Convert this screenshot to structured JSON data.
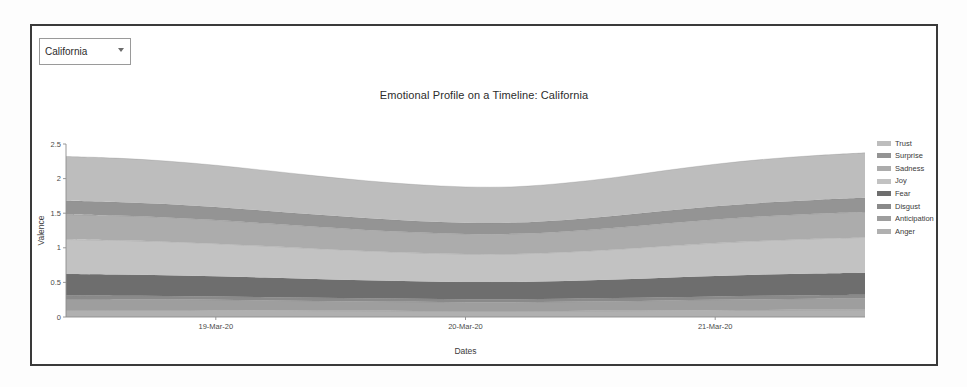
{
  "panel": {
    "state_filter": {
      "selected": "California",
      "options": [
        "California"
      ],
      "caret_icon": "chevron-down-icon"
    }
  },
  "chart_data": {
    "type": "area",
    "stacked": true,
    "title": "Emotional Profile on a Timeline: California",
    "xlabel": "Dates",
    "ylabel": "Valence",
    "ylim": [
      0,
      2.5
    ],
    "yticks": [
      0,
      0.5,
      1,
      1.5,
      2,
      2.5
    ],
    "ytick_labels": [
      "0",
      "0.5",
      "1",
      "1.5",
      "2",
      "2.5"
    ],
    "xticks": [
      "19-Mar-20",
      "20-Mar-20",
      "21-Mar-20"
    ],
    "xtick_positions": [
      0.1875,
      0.5,
      0.8125
    ],
    "grid": false,
    "legend_position": "right",
    "legend_order": [
      "Trust",
      "Surprise",
      "Sadness",
      "Joy",
      "Fear",
      "Disgust",
      "Anticipation",
      "Anger"
    ],
    "x": [
      0,
      0.0625,
      0.125,
      0.1875,
      0.25,
      0.3125,
      0.375,
      0.4375,
      0.5,
      0.5625,
      0.625,
      0.6875,
      0.75,
      0.8125,
      0.875,
      0.9375,
      1
    ],
    "series": [
      {
        "name": "Anger",
        "color": "#b0b0b0",
        "values": [
          0.1,
          0.1,
          0.1,
          0.098,
          0.095,
          0.092,
          0.09,
          0.088,
          0.086,
          0.086,
          0.088,
          0.09,
          0.094,
          0.098,
          0.1,
          0.103,
          0.105
        ]
      },
      {
        "name": "Anticipation",
        "color": "#9e9e9e",
        "values": [
          0.16,
          0.158,
          0.155,
          0.15,
          0.145,
          0.14,
          0.135,
          0.131,
          0.128,
          0.128,
          0.132,
          0.138,
          0.145,
          0.152,
          0.158,
          0.162,
          0.165
        ]
      },
      {
        "name": "Disgust",
        "color": "#8a8a8a",
        "values": [
          0.05,
          0.05,
          0.049,
          0.048,
          0.047,
          0.046,
          0.045,
          0.044,
          0.043,
          0.043,
          0.044,
          0.045,
          0.047,
          0.048,
          0.05,
          0.051,
          0.052
        ]
      },
      {
        "name": "Fear",
        "color": "#6e6e6e",
        "values": [
          0.31,
          0.305,
          0.3,
          0.292,
          0.283,
          0.272,
          0.262,
          0.254,
          0.25,
          0.25,
          0.258,
          0.27,
          0.283,
          0.295,
          0.305,
          0.312,
          0.318
        ]
      },
      {
        "name": "Joy",
        "color": "#c2c2c2",
        "values": [
          0.5,
          0.495,
          0.485,
          0.472,
          0.455,
          0.438,
          0.422,
          0.41,
          0.403,
          0.404,
          0.415,
          0.433,
          0.455,
          0.475,
          0.49,
          0.502,
          0.51
        ]
      },
      {
        "name": "Sadness",
        "color": "#acacac",
        "values": [
          0.36,
          0.357,
          0.35,
          0.34,
          0.328,
          0.316,
          0.305,
          0.296,
          0.29,
          0.291,
          0.299,
          0.312,
          0.328,
          0.342,
          0.353,
          0.361,
          0.367
        ]
      },
      {
        "name": "Surprise",
        "color": "#949494",
        "values": [
          0.2,
          0.198,
          0.195,
          0.19,
          0.183,
          0.176,
          0.17,
          0.165,
          0.162,
          0.162,
          0.167,
          0.174,
          0.183,
          0.191,
          0.197,
          0.201,
          0.205
        ]
      },
      {
        "name": "Trust",
        "color": "#bdbdbd",
        "values": [
          0.64,
          0.633,
          0.62,
          0.603,
          0.582,
          0.56,
          0.541,
          0.526,
          0.518,
          0.519,
          0.533,
          0.555,
          0.582,
          0.607,
          0.627,
          0.641,
          0.65
        ]
      }
    ]
  }
}
